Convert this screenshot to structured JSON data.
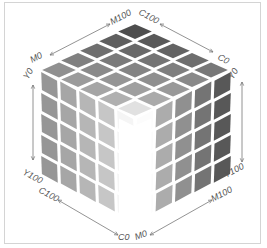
{
  "diagram": {
    "grid_size": 5,
    "axes": {
      "top_left": {
        "start": "M0",
        "end": "M100"
      },
      "top_right": {
        "start": "C100",
        "end": "C0"
      },
      "left_vertical": {
        "start": "Y0",
        "end": "Y100"
      },
      "right_vertical": {
        "start": "Y0",
        "end": "Y100"
      },
      "bottom_left": {
        "start": "C100",
        "end": "C0"
      },
      "bottom_right": {
        "start": "M0",
        "end": "M100"
      }
    },
    "colors": {
      "border": "#d4d4d4",
      "grid_gap": "#ffffff",
      "label": "#555555",
      "arrow": "#777777"
    }
  }
}
